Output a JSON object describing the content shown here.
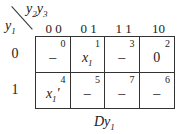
{
  "diagram": {
    "type": "karnaugh-map",
    "corner": {
      "col_var": "y2y3",
      "row_var": "y1"
    },
    "col_headers": [
      "0 0",
      "0 1",
      "1 1",
      "10"
    ],
    "row_headers": [
      "0",
      "1"
    ],
    "cells": [
      [
        {
          "index": "0",
          "value": "–"
        },
        {
          "index": "1",
          "value": "x1"
        },
        {
          "index": "3",
          "value": "–"
        },
        {
          "index": "2",
          "value": "0"
        }
      ],
      [
        {
          "index": "4",
          "value": "x1'"
        },
        {
          "index": "5",
          "value": "–"
        },
        {
          "index": "7",
          "value": "–"
        },
        {
          "index": "6",
          "value": "–"
        }
      ]
    ],
    "caption": "Dy1"
  }
}
